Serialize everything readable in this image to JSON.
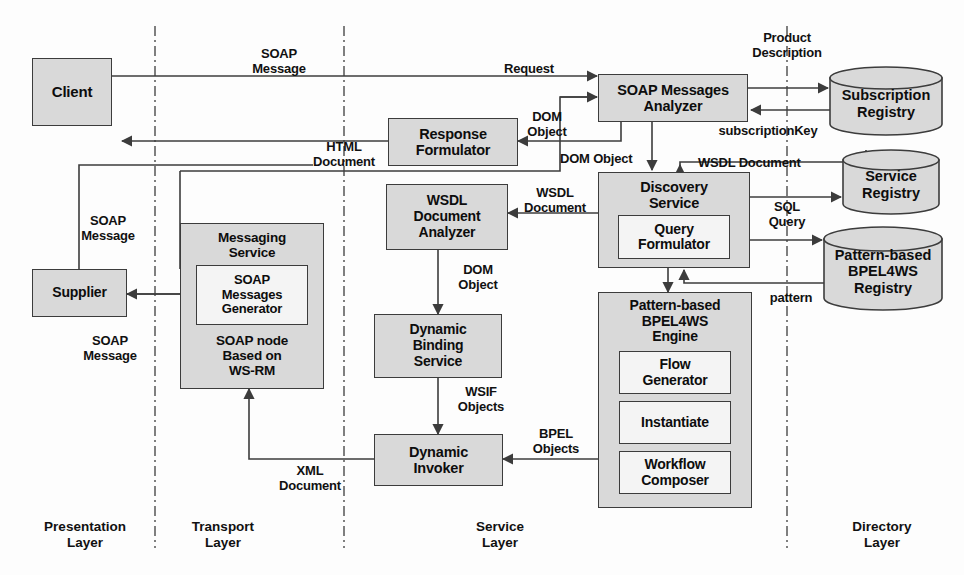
{
  "diagram": {
    "colors": {
      "node_fill": "#d9d9d9",
      "inner_fill": "#f4f4f4",
      "stroke": "#3c3c3c",
      "text": "#0d0d0d",
      "divider": "#555555"
    }
  },
  "nodes": {
    "client": {
      "label": "Client"
    },
    "supplier": {
      "label": "Supplier"
    },
    "messaging_service": {
      "label": "Messaging\nService",
      "inner": {
        "label": "SOAP\nMessages\nGenerator"
      },
      "footer": "SOAP node\nBased on\nWS-RM"
    },
    "response_formulator": {
      "label": "Response\nFormulator"
    },
    "wsdl_document_analyzer": {
      "label": "WSDL\nDocument\nAnalyzer"
    },
    "dynamic_binding_service": {
      "label": "Dynamic\nBinding\nService"
    },
    "dynamic_invoker": {
      "label": "Dynamic\nInvoker"
    },
    "soap_messages_analyzer": {
      "label": "SOAP Messages\nAnalyzer"
    },
    "discovery_service": {
      "label": "Discovery\nService",
      "inner": {
        "label": "Query\nFormulator"
      }
    },
    "bpel_engine": {
      "label": "Pattern-based\nBPEL4WS\nEngine",
      "inner1": {
        "label": "Flow\nGenerator"
      },
      "inner2": {
        "label": "Instantiate"
      },
      "inner3": {
        "label": "Workflow\nComposer"
      }
    }
  },
  "registries": {
    "subscription": {
      "label": "Subscription\nRegistry"
    },
    "service": {
      "label": "Service\nRegistry"
    },
    "bpel": {
      "label": "Pattern-based\nBPEL4WS\nRegistry"
    }
  },
  "edge_labels": {
    "soap_message_top": "SOAP\nMessage",
    "request": "Request",
    "product_description": "Product\nDescription",
    "dom_object_analyzer": "DOM\nObject",
    "subscription_key": "subscriptionKey",
    "html_document": "HTML\nDocument",
    "dom_object_discovery": "DOM Object",
    "wsdl_document_right": "WSDL Document",
    "wsdl_document_left": "WSDL\nDocument",
    "soap_message_supplier_in": "SOAP\nMessage",
    "soap_message_supplier_out": "SOAP\nMessage",
    "dom_object_binding": "DOM\nObject",
    "sql_query": "SQL\nQuery",
    "pattern": "pattern",
    "wsif_objects": "WSIF\nObjects",
    "bpel_objects": "BPEL\nObjects",
    "xml_document": "XML\nDocument"
  },
  "layers": [
    {
      "label": "Presentation\nLayer"
    },
    {
      "label": "Transport\nLayer"
    },
    {
      "label": "Service\nLayer"
    },
    {
      "label": "Directory\nLayer"
    }
  ]
}
